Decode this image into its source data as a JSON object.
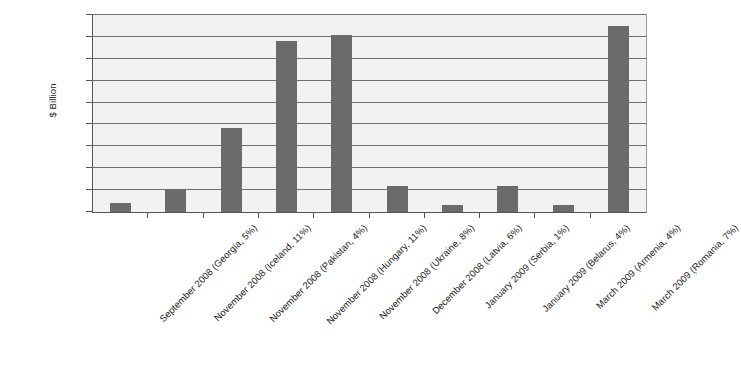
{
  "chart_data": {
    "type": "bar",
    "title": "",
    "xlabel": "",
    "ylabel": "$ Billion",
    "ylim": [
      0,
      18
    ],
    "yticks": [
      0,
      2,
      4,
      6,
      8,
      10,
      12,
      14,
      16,
      18
    ],
    "grid": true,
    "legend": null,
    "bar_color": "#6b6b6b",
    "plot_background": "#f2f2f2",
    "categories": [
      "September 2008 (Georgia, 5%)",
      "November 2008 (Iceland, 11%)",
      "November 2008 (Pakistan, 4%)",
      "November 2008 (Hungary, 11%)",
      "November 2008 (Ukraine, 8%)",
      "December 2008 (Latvia, 6%)",
      "January 2009 (Serbia, 1%)",
      "January 2009 (Belarus, 4%)",
      "March 2009 (Armenia, 4%)",
      "March 2009 (Romania, 7%)"
    ],
    "values": [
      0.85,
      2.1,
      7.7,
      15.6,
      16.2,
      2.4,
      0.6,
      2.4,
      0.6,
      17.0
    ]
  }
}
